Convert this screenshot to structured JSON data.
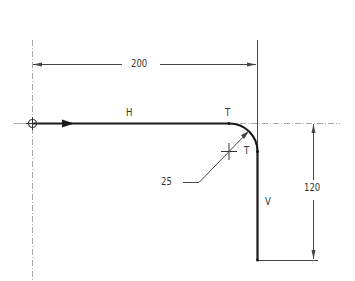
{
  "drawing": {
    "dimensions": {
      "horizontal": "200",
      "vertical": "120",
      "radius": "25"
    },
    "labels": {
      "horizontal_segment": "H",
      "vertical_segment": "V",
      "tangent_point_1": "T",
      "tangent_point_2": "T"
    },
    "colors": {
      "path": "#1a1a1a",
      "dimension": "#333333",
      "centerline": "#999999"
    }
  }
}
